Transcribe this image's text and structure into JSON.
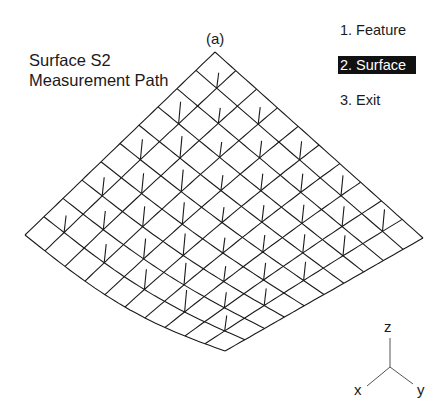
{
  "plot": {
    "title_line1": "Surface S2",
    "title_line2": "Measurement Path",
    "panel_label": "(a)"
  },
  "menu": {
    "items": [
      {
        "label": "1. Feature",
        "selected": false
      },
      {
        "label": "2. Surface",
        "selected": true
      },
      {
        "label": "3. Exit",
        "selected": false
      }
    ]
  },
  "axes": {
    "x": "x",
    "y": "y",
    "z": "z"
  },
  "mesh": {
    "rows": 10,
    "cols": 10,
    "corners": {
      "top": [
        215,
        52
      ],
      "left": [
        25,
        235
      ],
      "right": [
        423,
        238
      ],
      "bottom": [
        225,
        351
      ]
    },
    "stroke": "#1a1a1a",
    "stub_length": 22
  }
}
